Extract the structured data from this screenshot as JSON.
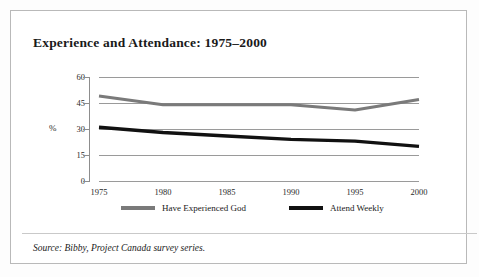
{
  "figure": {
    "title": "Experience and Attendance: 1975–2000",
    "source_note": "Source: Bibby, Project Canada survey series.",
    "frame_color": "#b9b9b9",
    "background": "#ffffff"
  },
  "axes": {
    "y_axis_title": "%",
    "y_ticks": [
      "60",
      "45",
      "30",
      "15",
      "0"
    ],
    "x_ticks": [
      "1975",
      "1980",
      "1985",
      "1990",
      "1995",
      "2000"
    ]
  },
  "legend": {
    "position": "bottom",
    "items": [
      {
        "label": "Have Experienced God",
        "color": "#7a7a7a"
      },
      {
        "label": "Attend Weekly",
        "color": "#111111"
      }
    ]
  },
  "chart_data": {
    "type": "line",
    "title": "Experience and Attendance: 1975–2000",
    "subtitle": "",
    "xlabel": "",
    "ylabel": "%",
    "categories": [
      "1975",
      "1980",
      "1985",
      "1990",
      "1995",
      "2000"
    ],
    "x": [
      1975,
      1980,
      1985,
      1990,
      1995,
      2000
    ],
    "series": [
      {
        "name": "Have Experienced God",
        "color": "#7a7a7a",
        "values": [
          49,
          44,
          44,
          44,
          41,
          47
        ]
      },
      {
        "name": "Attend Weekly",
        "color": "#111111",
        "values": [
          31,
          28,
          26,
          24,
          23,
          20
        ]
      }
    ],
    "ylim": [
      0,
      60
    ],
    "ytick_step": 15,
    "xlim": [
      1975,
      2000
    ],
    "grid": true,
    "grid_axis": "y",
    "legend_position": "bottom",
    "annotations": [
      "Source: Bibby, Project Canada survey series."
    ]
  }
}
